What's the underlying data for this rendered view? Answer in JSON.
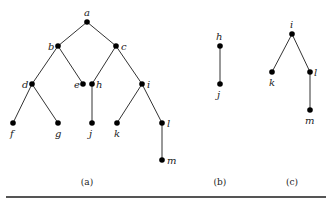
{
  "figures": [
    {
      "caption": "(a)",
      "nodes": {
        "a": {
          "label": "a",
          "x": 87,
          "y": 22,
          "lx": 84,
          "ly": 16
        },
        "b": {
          "label": "b",
          "x": 58,
          "y": 46,
          "lx": 48,
          "ly": 50
        },
        "c": {
          "label": "c",
          "x": 116,
          "y": 46,
          "lx": 121,
          "ly": 50
        },
        "d": {
          "label": "d",
          "x": 32,
          "y": 84,
          "lx": 22,
          "ly": 88
        },
        "e": {
          "label": "e",
          "x": 83,
          "y": 84,
          "lx": 74,
          "ly": 88
        },
        "h": {
          "label": "h",
          "x": 92,
          "y": 84,
          "lx": 96,
          "ly": 88
        },
        "i": {
          "label": "i",
          "x": 142,
          "y": 84,
          "lx": 147,
          "ly": 88
        },
        "f": {
          "label": "f",
          "x": 13,
          "y": 123,
          "lx": 10,
          "ly": 137
        },
        "g": {
          "label": "g",
          "x": 58,
          "y": 123,
          "lx": 55,
          "ly": 137
        },
        "j": {
          "label": "j",
          "x": 92,
          "y": 123,
          "lx": 89,
          "ly": 137
        },
        "k": {
          "label": "k",
          "x": 117,
          "y": 123,
          "lx": 114,
          "ly": 137
        },
        "l": {
          "label": "l",
          "x": 162,
          "y": 123,
          "lx": 167,
          "ly": 127
        },
        "m": {
          "label": "m",
          "x": 162,
          "y": 160,
          "lx": 167,
          "ly": 164
        }
      },
      "edges": [
        [
          "a",
          "b"
        ],
        [
          "a",
          "c"
        ],
        [
          "b",
          "d"
        ],
        [
          "b",
          "e"
        ],
        [
          "c",
          "h"
        ],
        [
          "c",
          "i"
        ],
        [
          "d",
          "f"
        ],
        [
          "d",
          "g"
        ],
        [
          "h",
          "j"
        ],
        [
          "i",
          "k"
        ],
        [
          "i",
          "l"
        ],
        [
          "l",
          "m"
        ]
      ],
      "caption_x": 87
    },
    {
      "caption": "(b)",
      "nodes": {
        "h": {
          "label": "h",
          "x": 220,
          "y": 46,
          "lx": 216,
          "ly": 40
        },
        "j": {
          "label": "j",
          "x": 220,
          "y": 84,
          "lx": 217,
          "ly": 98
        }
      },
      "edges": [
        [
          "h",
          "j"
        ]
      ],
      "caption_x": 220
    },
    {
      "caption": "(c)",
      "nodes": {
        "i": {
          "label": "i",
          "x": 292,
          "y": 34,
          "lx": 290,
          "ly": 28
        },
        "k": {
          "label": "k",
          "x": 272,
          "y": 72,
          "lx": 269,
          "ly": 86
        },
        "l": {
          "label": "l",
          "x": 310,
          "y": 72,
          "lx": 314,
          "ly": 76
        },
        "m": {
          "label": "m",
          "x": 310,
          "y": 110,
          "lx": 305,
          "ly": 124
        }
      },
      "edges": [
        [
          "i",
          "k"
        ],
        [
          "i",
          "l"
        ],
        [
          "l",
          "m"
        ]
      ],
      "caption_x": 292
    }
  ],
  "caption_y": 185,
  "rule": {
    "x1": 6,
    "x2": 326,
    "y": 197
  }
}
